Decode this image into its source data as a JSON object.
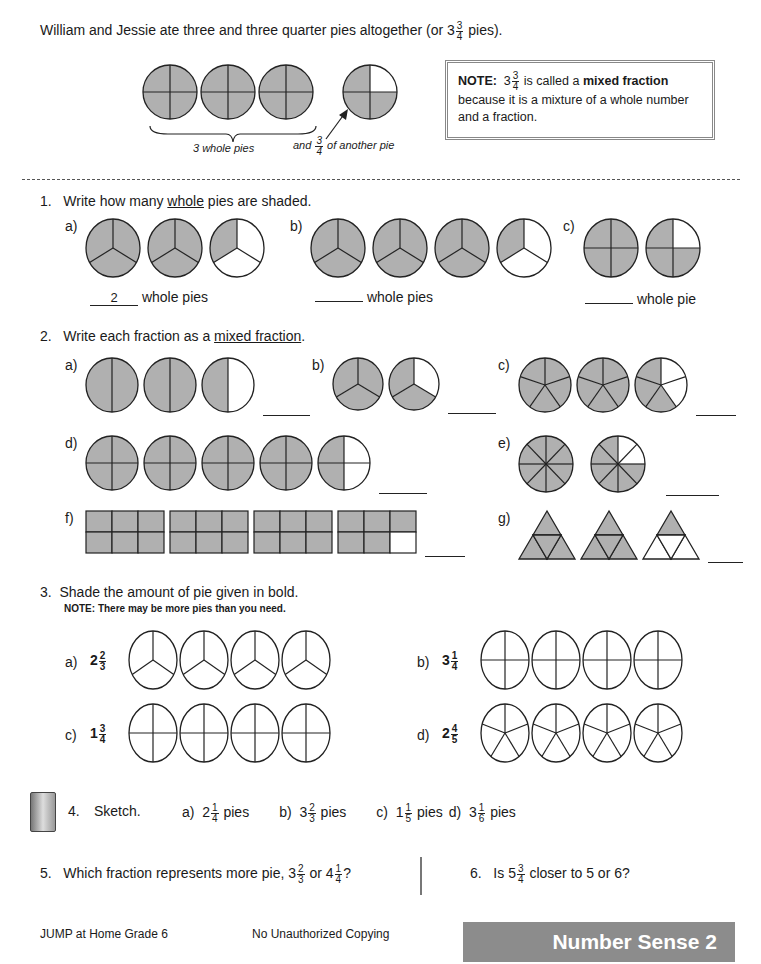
{
  "colors": {
    "shade": "#b0b0b0",
    "line": "#222222",
    "footer": "#8c8c8c"
  },
  "intro": {
    "sentence_pre": "William and Jessie ate three and three quarter pies altogether (or 3",
    "sentence_frac": {
      "n": "3",
      "d": "4"
    },
    "sentence_post": "pies).",
    "caption_whole": "3 whole pies",
    "caption_and": "and",
    "caption_frac": {
      "n": "3",
      "d": "4"
    },
    "caption_rest": "of another pie",
    "pies": [
      {
        "parts": 4,
        "shaded": 4
      },
      {
        "parts": 4,
        "shaded": 4
      },
      {
        "parts": 4,
        "shaded": 4
      },
      {
        "parts": 4,
        "shaded": 3
      }
    ],
    "note": {
      "label": "NOTE:",
      "whole": "3",
      "frac": {
        "n": "3",
        "d": "4"
      },
      "mid": "is called a",
      "term": "mixed fraction",
      "line2": "because it is a mixture of a whole number",
      "line3": "and a fraction."
    }
  },
  "q1": {
    "number": "1.",
    "prompt_pre": "Write how many",
    "prompt_u": "whole",
    "prompt_post": "pies are shaded.",
    "parts": [
      {
        "label": "a)",
        "answer": "2",
        "suffix": "whole pies",
        "pies": [
          {
            "parts": 3,
            "shaded": 3
          },
          {
            "parts": 3,
            "shaded": 3
          },
          {
            "parts": 3,
            "shaded": 1
          }
        ]
      },
      {
        "label": "b)",
        "answer": "",
        "suffix": "whole pies",
        "pies": [
          {
            "parts": 3,
            "shaded": 3
          },
          {
            "parts": 3,
            "shaded": 3
          },
          {
            "parts": 3,
            "shaded": 3
          },
          {
            "parts": 3,
            "shaded": 1
          }
        ]
      },
      {
        "label": "c)",
        "answer": "",
        "suffix": "whole pie",
        "pies": [
          {
            "parts": 4,
            "shaded": 4
          },
          {
            "parts": 4,
            "shaded": 3
          }
        ]
      }
    ]
  },
  "q2": {
    "number": "2.",
    "prompt_pre": "Write each fraction as a",
    "prompt_u": "mixed fraction",
    "prompt_post": ".",
    "parts": [
      {
        "label": "a)",
        "type": "pie",
        "items": [
          {
            "parts": 2,
            "shaded": 2
          },
          {
            "parts": 2,
            "shaded": 2
          },
          {
            "parts": 2,
            "shaded": 1
          }
        ]
      },
      {
        "label": "b)",
        "type": "pie",
        "items": [
          {
            "parts": 3,
            "shaded": 3
          },
          {
            "parts": 3,
            "shaded": 2
          }
        ]
      },
      {
        "label": "c)",
        "type": "pie",
        "items": [
          {
            "parts": 5,
            "shaded": 5
          },
          {
            "parts": 5,
            "shaded": 5
          },
          {
            "parts": 5,
            "shaded": 3
          }
        ]
      },
      {
        "label": "d)",
        "type": "pie",
        "items": [
          {
            "parts": 4,
            "shaded": 4
          },
          {
            "parts": 4,
            "shaded": 4
          },
          {
            "parts": 4,
            "shaded": 4
          },
          {
            "parts": 4,
            "shaded": 4
          },
          {
            "parts": 4,
            "shaded": 2
          }
        ]
      },
      {
        "label": "e)",
        "type": "pie",
        "items": [
          {
            "parts": 8,
            "shaded": 8
          },
          {
            "parts": 8,
            "shaded": 6
          }
        ]
      },
      {
        "label": "f)",
        "type": "rect",
        "items": [
          {
            "parts": 6,
            "shaded": 6
          },
          {
            "parts": 6,
            "shaded": 6
          },
          {
            "parts": 6,
            "shaded": 6
          },
          {
            "parts": 6,
            "shaded": 5
          }
        ]
      },
      {
        "label": "g)",
        "type": "tri",
        "items": [
          {
            "parts": 4,
            "shaded": 4
          },
          {
            "parts": 4,
            "shaded": 4
          },
          {
            "parts": 4,
            "shaded": 1
          }
        ]
      }
    ]
  },
  "q3": {
    "number": "3.",
    "prompt": "Shade the amount of pie given in bold.",
    "note": "NOTE:  There may be more pies than you need.",
    "parts": [
      {
        "label": "a)",
        "whole": "2",
        "n": "2",
        "d": "3",
        "parts": 3,
        "count": 4
      },
      {
        "label": "b)",
        "whole": "3",
        "n": "1",
        "d": "4",
        "parts": 4,
        "count": 4
      },
      {
        "label": "c)",
        "whole": "1",
        "n": "3",
        "d": "4",
        "parts": 4,
        "count": 4
      },
      {
        "label": "d)",
        "whole": "2",
        "n": "4",
        "d": "5",
        "parts": 5,
        "count": 4
      }
    ]
  },
  "q4": {
    "number": "4.",
    "prompt": "Sketch.",
    "icon": "notebook-icon",
    "items": [
      {
        "label": "a)",
        "whole": "2",
        "n": "1",
        "d": "4",
        "suffix": "pies"
      },
      {
        "label": "b)",
        "whole": "3",
        "n": "2",
        "d": "3",
        "suffix": "pies"
      },
      {
        "label": "c)",
        "whole": "1",
        "n": "1",
        "d": "5",
        "suffix": "pies"
      },
      {
        "label": "d)",
        "whole": "3",
        "n": "1",
        "d": "6",
        "suffix": "pies"
      }
    ]
  },
  "q5": {
    "number": "5.",
    "pre": "Which fraction represents more pie, 3",
    "f1": {
      "n": "2",
      "d": "3"
    },
    "mid": "or 4",
    "f2": {
      "n": "1",
      "d": "4"
    },
    "post": "?"
  },
  "q6": {
    "number": "6.",
    "pre": "Is 5",
    "f": {
      "n": "3",
      "d": "4"
    },
    "post": "closer to 5 or 6?"
  },
  "footer": {
    "left": "JUMP at Home Grade 6",
    "center": "No Unauthorized Copying",
    "section": "Number Sense 2"
  }
}
